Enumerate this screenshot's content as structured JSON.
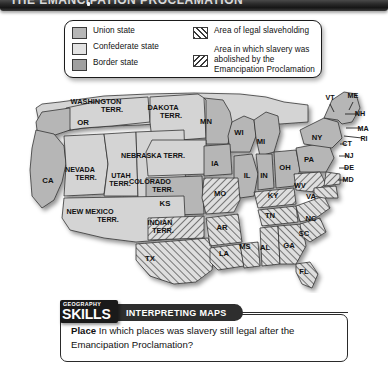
{
  "banner": {
    "title": "THE EMANCIPATION PROCLAMATION",
    "dot": ""
  },
  "legend": {
    "items": [
      {
        "key": "union-state",
        "label": "Union state",
        "swatch": "solid",
        "color": "#b6b6b6"
      },
      {
        "key": "confederate-state",
        "label": "Confederate state",
        "swatch": "solid",
        "color": "#e2e2e2"
      },
      {
        "key": "border-state",
        "label": "Border state",
        "swatch": "solid",
        "color": "#a0a0a0"
      },
      {
        "key": "legal-slaveholding",
        "label": "Area of legal slaveholding",
        "swatch": "hatch-forward",
        "color": "#3a3a3a"
      },
      {
        "key": "abolished",
        "label": "Area in which slavery was abolished by the Emancipation Proclamation",
        "swatch": "hatch-back",
        "color": "#3a3a3a"
      }
    ]
  },
  "map": {
    "labels": [
      {
        "id": "wa-terr",
        "text": "WASHINGTON",
        "x": 88,
        "y": 26,
        "size": 7.4
      },
      {
        "id": "wa-terr2",
        "text": "TERR.",
        "x": 104,
        "y": 34,
        "size": 7.4
      },
      {
        "id": "or",
        "text": "OR",
        "x": 75,
        "y": 47,
        "size": 7.8
      },
      {
        "id": "ca",
        "text": "CA",
        "x": 40,
        "y": 105,
        "size": 7.8
      },
      {
        "id": "nv-terr",
        "text": "NEVADA",
        "x": 72,
        "y": 94,
        "size": 7.2
      },
      {
        "id": "nv-terr2",
        "text": "TERR.",
        "x": 78,
        "y": 102,
        "size": 7.2
      },
      {
        "id": "ut-terr",
        "text": "UTAH",
        "x": 113,
        "y": 100,
        "size": 7.2
      },
      {
        "id": "ut-terr2",
        "text": "TERR.",
        "x": 112,
        "y": 108,
        "size": 7.2
      },
      {
        "id": "co-terr",
        "text": "COLORADO",
        "x": 142,
        "y": 106,
        "size": 7.2
      },
      {
        "id": "co-terr2",
        "text": "TERR.",
        "x": 155,
        "y": 114,
        "size": 7.2
      },
      {
        "id": "dakota",
        "text": "DAKOTA",
        "x": 155,
        "y": 32,
        "size": 7.4
      },
      {
        "id": "dakota2",
        "text": "TERR.",
        "x": 163,
        "y": 40,
        "size": 7.4
      },
      {
        "id": "nebraska",
        "text": "NEBRASKA TERR.",
        "x": 145,
        "y": 80,
        "size": 7.2
      },
      {
        "id": "nm-terr",
        "text": "NEW MEXICO",
        "x": 82,
        "y": 136,
        "size": 7.2
      },
      {
        "id": "nm-terr2",
        "text": "TERR.",
        "x": 100,
        "y": 144,
        "size": 7.2
      },
      {
        "id": "ks",
        "text": "KS",
        "x": 157,
        "y": 128,
        "size": 7.8
      },
      {
        "id": "indian",
        "text": "INDIAN",
        "x": 152,
        "y": 147,
        "size": 7.2
      },
      {
        "id": "indian2",
        "text": "TERR.",
        "x": 155,
        "y": 155,
        "size": 7.2
      },
      {
        "id": "tx",
        "text": "TX",
        "x": 142,
        "y": 183,
        "size": 7.8
      },
      {
        "id": "mn",
        "text": "MN",
        "x": 198,
        "y": 46,
        "size": 7.6
      },
      {
        "id": "ia",
        "text": "IA",
        "x": 207,
        "y": 88,
        "size": 7.6
      },
      {
        "id": "mo",
        "text": "MO",
        "x": 212,
        "y": 118,
        "size": 7.6
      },
      {
        "id": "ar",
        "text": "AR",
        "x": 214,
        "y": 152,
        "size": 7.6
      },
      {
        "id": "la",
        "text": "LA",
        "x": 216,
        "y": 178,
        "size": 7.6
      },
      {
        "id": "wi",
        "text": "WI",
        "x": 231,
        "y": 57,
        "size": 7.6
      },
      {
        "id": "il",
        "text": "IL",
        "x": 239,
        "y": 100,
        "size": 7.6
      },
      {
        "id": "ms",
        "text": "MS",
        "x": 237,
        "y": 171,
        "size": 7.6
      },
      {
        "id": "mi",
        "text": "MI",
        "x": 253,
        "y": 66,
        "size": 7.6
      },
      {
        "id": "in",
        "text": "IN",
        "x": 256,
        "y": 100,
        "size": 7.6
      },
      {
        "id": "ky",
        "text": "KY",
        "x": 265,
        "y": 120,
        "size": 7.6
      },
      {
        "id": "tn",
        "text": "TN",
        "x": 262,
        "y": 140,
        "size": 7.6
      },
      {
        "id": "al",
        "text": "AL",
        "x": 257,
        "y": 172,
        "size": 7.6
      },
      {
        "id": "ga",
        "text": "GA",
        "x": 281,
        "y": 170,
        "size": 7.6
      },
      {
        "id": "oh",
        "text": "OH",
        "x": 277,
        "y": 92,
        "size": 7.6
      },
      {
        "id": "wv",
        "text": "WV",
        "x": 292,
        "y": 110,
        "size": 7.0
      },
      {
        "id": "va",
        "text": "VA",
        "x": 303,
        "y": 121,
        "size": 7.6
      },
      {
        "id": "nc",
        "text": "NC",
        "x": 303,
        "y": 143,
        "size": 7.6
      },
      {
        "id": "sc",
        "text": "SC",
        "x": 296,
        "y": 158,
        "size": 7.6
      },
      {
        "id": "fl",
        "text": "FL",
        "x": 296,
        "y": 196,
        "size": 7.6
      },
      {
        "id": "pa",
        "text": "PA",
        "x": 301,
        "y": 84,
        "size": 7.6
      },
      {
        "id": "ny",
        "text": "NY",
        "x": 309,
        "y": 62,
        "size": 7.6
      },
      {
        "id": "vt",
        "text": "VT",
        "x": 322,
        "y": 22,
        "size": 7.2
      },
      {
        "id": "me",
        "text": "ME",
        "x": 345,
        "y": 20,
        "size": 7.2
      },
      {
        "id": "nh",
        "text": "NH",
        "x": 352,
        "y": 38,
        "size": 7.2
      },
      {
        "id": "ma",
        "text": "MA",
        "x": 355,
        "y": 53,
        "size": 7.2
      },
      {
        "id": "ri",
        "text": "RI",
        "x": 356,
        "y": 63,
        "size": 7.0
      },
      {
        "id": "ct",
        "text": "CT",
        "x": 339,
        "y": 68,
        "size": 7.2
      },
      {
        "id": "nj",
        "text": "NJ",
        "x": 341,
        "y": 80,
        "size": 7.2
      },
      {
        "id": "de",
        "text": "DE",
        "x": 341,
        "y": 92,
        "size": 7.2
      },
      {
        "id": "md",
        "text": "MD",
        "x": 340,
        "y": 104,
        "size": 7.2
      }
    ]
  },
  "caption": {
    "badge_top": "GEOGRAPHY",
    "badge_main": "SKILLS",
    "tab": "INTERPRETING MAPS",
    "question_lead": "Place",
    "question": "In which places was slavery still legal after the Emancipation Proclamation?"
  },
  "colors": {
    "union": "#b6b6b6",
    "confederate": "#e2e2e2",
    "border_state": "#a0a0a0",
    "territory": "#d4d4d4",
    "hatch": "#3a3a3a",
    "outline": "#2b2b2b",
    "banner": "#1a1a1a"
  }
}
